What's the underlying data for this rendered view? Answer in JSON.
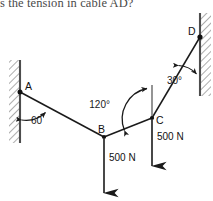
{
  "question": {
    "text": "s the tension in cable AD?"
  },
  "diagram": {
    "colors": {
      "line": "#1a1a1a",
      "hatch": "#7a7a7a",
      "wall": "#4d4d4d",
      "text": "#111111",
      "background": "#ffffff"
    },
    "points": [
      {
        "id": "A",
        "label": "A",
        "x": 20,
        "y": 92
      },
      {
        "id": "B",
        "label": "B",
        "x": 104,
        "y": 137
      },
      {
        "id": "C",
        "label": "C",
        "x": 152,
        "y": 118
      },
      {
        "id": "D",
        "label": "D",
        "x": 200,
        "y": 37
      }
    ],
    "angles": [
      {
        "id": "angle-A",
        "label": "60",
        "value": 60,
        "unit": "",
        "x": 38,
        "y": 118,
        "at": "A",
        "between": "wall-AB"
      },
      {
        "id": "angle-C",
        "label": "120°",
        "value": 120,
        "unit": "deg",
        "x": 101,
        "y": 106,
        "at": "C",
        "between": "BC-vertical"
      },
      {
        "id": "angle-D",
        "label": "30°",
        "value": 30,
        "unit": "deg",
        "x": 168,
        "y": 81,
        "at": "D",
        "between": "wall-DC"
      }
    ],
    "forces": [
      {
        "id": "force-B",
        "label": "500 N",
        "magnitude": 500,
        "unit": "N",
        "direction": "down",
        "label_x": 110,
        "label_y": 158,
        "tail_x": 104,
        "tail_y": 139,
        "tip_x": 104,
        "tip_y": 193
      },
      {
        "id": "force-C",
        "label": "500 N",
        "magnitude": 500,
        "unit": "N",
        "direction": "down",
        "label_x": 157,
        "label_y": 137,
        "tail_x": 152,
        "tail_y": 120,
        "tip_x": 152,
        "tip_y": 166
      }
    ],
    "members": [
      {
        "id": "member-AB",
        "from": "A",
        "to": "B"
      },
      {
        "id": "member-BC",
        "from": "B",
        "to": "C"
      },
      {
        "id": "member-CD",
        "from": "C",
        "to": "D"
      }
    ],
    "walls": [
      {
        "id": "wall-left",
        "x": 20,
        "y_top": 60,
        "y_bottom": 143,
        "hatch_side": "left"
      },
      {
        "id": "wall-right",
        "x": 200,
        "y_top": 13,
        "y_bottom": 96,
        "hatch_side": "right"
      }
    ]
  }
}
